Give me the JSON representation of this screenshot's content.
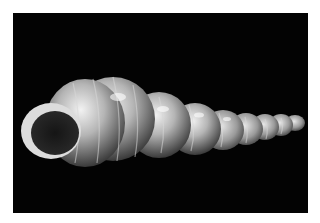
{
  "image": {
    "subject": "spiral seashell",
    "description": "White translucent turreted shell with ribbed whorls, aperture facing left, photographed against black background",
    "colors": {
      "background": "#030303",
      "border": "#ffffff",
      "shell_light": "#e6e6e6",
      "shell_mid": "#9a9a9a",
      "shell_dark": "#3a3a3a"
    }
  }
}
